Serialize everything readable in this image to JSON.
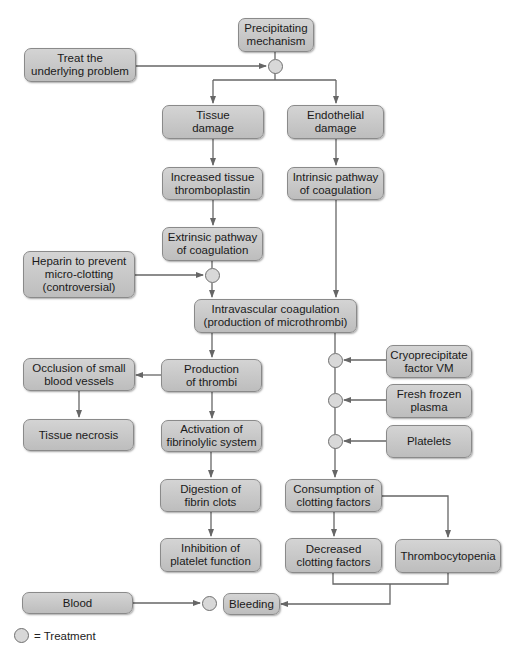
{
  "diagram": {
    "nodes": {
      "precipitating": "Precipitating\nmechanism",
      "treat_underlying": "Treat the\nunderlying problem",
      "tissue_damage": "Tissue\ndamage",
      "endothelial_damage": "Endothelial\ndamage",
      "increased_thromboplastin": "Increased tissue\nthromboplastin",
      "intrinsic": "Intrinsic pathway\nof coagulation",
      "extrinsic": "Extrinsic pathway\nof coagulation",
      "heparin": "Heparin to prevent\nmicro-clotting\n(controversial)",
      "intravascular": "Intravascular coagulation\n(production of microthrombi)",
      "production_thrombi": "Production\nof thrombi",
      "occlusion": "Occlusion of small\nblood vessels",
      "tissue_necrosis": "Tissue necrosis",
      "cryoprecipitate": "Cryoprecipitate\nfactor VM",
      "fresh_frozen_plasma": "Fresh frozen\nplasma",
      "platelets": "Platelets",
      "activation_fibrinolytic": "Activation of\nfibrinolylic system",
      "digestion_fibrin": "Digestion of\nfibrin clots",
      "inhibition_platelet": "Inhibition of\nplatelet function",
      "consumption_clotting": "Consumption of\nclotting factors",
      "decreased_clotting": "Decreased\nclotting factors",
      "thrombocytopenia": "Thrombocytopenia",
      "blood": "Blood",
      "bleeding": "Bleeding"
    },
    "legend": {
      "label": "= Treatment"
    },
    "colors": {
      "box_fill": "#c8c8c8",
      "line": "#666666",
      "circle_fill": "#d8d8d8"
    }
  }
}
